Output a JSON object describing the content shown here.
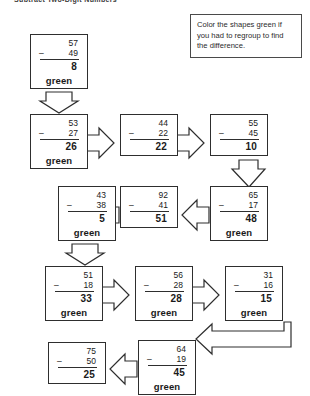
{
  "title": "Subtract Two-Digit Numbers",
  "instructions": "Color the shapes green if you had to regroup to find the difference.",
  "green_label": "green",
  "minus_sign": "–",
  "problems": [
    {
      "id": "p1",
      "minuend": "57",
      "subtrahend": "49",
      "answer": "8",
      "green": true
    },
    {
      "id": "p2",
      "minuend": "53",
      "subtrahend": "27",
      "answer": "26",
      "green": true
    },
    {
      "id": "p3",
      "minuend": "44",
      "subtrahend": "22",
      "answer": "22",
      "green": false
    },
    {
      "id": "p4",
      "minuend": "55",
      "subtrahend": "45",
      "answer": "10",
      "green": false
    },
    {
      "id": "p5",
      "minuend": "65",
      "subtrahend": "17",
      "answer": "48",
      "green": true
    },
    {
      "id": "p6",
      "minuend": "92",
      "subtrahend": "41",
      "answer": "51",
      "green": false
    },
    {
      "id": "p7",
      "minuend": "43",
      "subtrahend": "38",
      "answer": "5",
      "green": true
    },
    {
      "id": "p8",
      "minuend": "51",
      "subtrahend": "18",
      "answer": "33",
      "green": true
    },
    {
      "id": "p9",
      "minuend": "56",
      "subtrahend": "28",
      "answer": "28",
      "green": true
    },
    {
      "id": "p10",
      "minuend": "31",
      "subtrahend": "16",
      "answer": "15",
      "green": true
    },
    {
      "id": "p11",
      "minuend": "64",
      "subtrahend": "19",
      "answer": "45",
      "green": true
    },
    {
      "id": "p12",
      "minuend": "75",
      "subtrahend": "50",
      "answer": "25",
      "green": false
    }
  ]
}
